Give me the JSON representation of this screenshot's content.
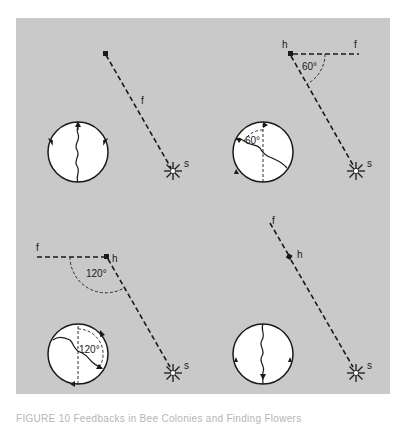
{
  "figure": {
    "background_color": "#c9c9c9",
    "line_color": "#1a1a1a",
    "panels": [
      {
        "id": "top-left",
        "labels": {
          "food": "f",
          "sun": "s"
        },
        "angle_label": "",
        "description": "Food source directly toward the sun; waggle run straight up"
      },
      {
        "id": "top-right",
        "labels": {
          "hive": "h",
          "food": "f",
          "sun": "s"
        },
        "angle_label": "60°",
        "comb_angle_label": "60°",
        "description": "Food 60° to the right of sun direction; waggle run 60° from vertical"
      },
      {
        "id": "bottom-left",
        "labels": {
          "hive": "h",
          "food": "f",
          "sun": "s"
        },
        "angle_label": "120°",
        "comb_angle_label": "120°",
        "description": "Food 120° to the left of sun direction; waggle run 120° from vertical"
      },
      {
        "id": "bottom-right",
        "labels": {
          "hive": "h",
          "food": "f",
          "sun": "s"
        },
        "angle_label": "",
        "description": "Food directly away from the sun; waggle run straight down"
      }
    ]
  },
  "caption": {
    "text": "FIGURE 10   Feedbacks in Bee Colonies and Finding Flowers"
  }
}
